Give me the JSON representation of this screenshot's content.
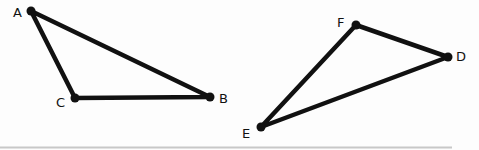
{
  "diagram": {
    "title": "",
    "triangles": [
      {
        "name": "ABC",
        "vertices": [
          {
            "label": "A",
            "x": 31,
            "y": 11,
            "lx": 13,
            "ly": 17
          },
          {
            "label": "B",
            "x": 210,
            "y": 97,
            "lx": 219,
            "ly": 103
          },
          {
            "label": "C",
            "x": 75,
            "y": 98,
            "lx": 56,
            "ly": 107
          }
        ]
      },
      {
        "name": "DEF",
        "vertices": [
          {
            "label": "D",
            "x": 448,
            "y": 57,
            "lx": 456,
            "ly": 61
          },
          {
            "label": "E",
            "x": 261,
            "y": 127,
            "lx": 242,
            "ly": 138
          },
          {
            "label": "F",
            "x": 356,
            "y": 25,
            "lx": 337,
            "ly": 27
          }
        ]
      }
    ],
    "colors": {
      "stroke": "#111111",
      "background": "#fdfdfd",
      "rule": "#c8c8c8"
    }
  }
}
